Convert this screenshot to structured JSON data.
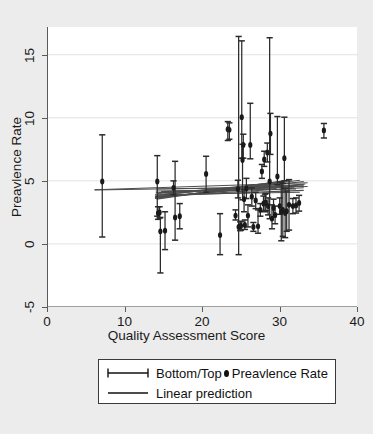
{
  "chart_data": {
    "type": "scatter",
    "title": "",
    "xlabel": "Quality Assessment Score",
    "ylabel": "Preavlence Rate",
    "xlim": [
      0,
      40
    ],
    "ylim": [
      -5,
      17.2
    ],
    "xticks": [
      0,
      10,
      20,
      30,
      40
    ],
    "yticks": [
      -5,
      0,
      5,
      10,
      15
    ],
    "grid": "horizontal",
    "legend_position": "below-axis",
    "series": [
      {
        "name": "Bottom/Top",
        "type": "errorbar",
        "marker": "capped-vertical-line"
      },
      {
        "name": "Preavlence Rate",
        "type": "scatter",
        "marker": "filled-circle",
        "color": "#1a1a1a"
      },
      {
        "name": "Linear prediction",
        "type": "line",
        "color": "#4d4d4d"
      }
    ],
    "points": [
      {
        "x": 7.0,
        "y": 4.95,
        "lo": 0.55,
        "hi": 8.65
      },
      {
        "x": 14.1,
        "y": 4.95,
        "lo": 2.2,
        "hi": 7.0
      },
      {
        "x": 14.2,
        "y": 2.45,
        "lo": 1.95,
        "hi": 2.95
      },
      {
        "x": 14.4,
        "y": 2.5,
        "lo": 2.05,
        "hi": 2.95
      },
      {
        "x": 14.5,
        "y": 1.0,
        "lo": -2.3,
        "hi": 2.1
      },
      {
        "x": 15.1,
        "y": 1.05,
        "lo": -0.45,
        "hi": 2.55
      },
      {
        "x": 16.2,
        "y": 4.45,
        "lo": 3.9,
        "hi": 5.0
      },
      {
        "x": 16.4,
        "y": 2.1,
        "lo": 0.3,
        "hi": 6.55
      },
      {
        "x": 17.0,
        "y": 2.2,
        "lo": 1.2,
        "hi": 3.2
      },
      {
        "x": 20.4,
        "y": 5.55,
        "lo": 4.1,
        "hi": 6.95
      },
      {
        "x": 22.2,
        "y": 0.7,
        "lo": -0.85,
        "hi": 2.4
      },
      {
        "x": 23.2,
        "y": 9.1,
        "lo": 8.2,
        "hi": 9.7
      },
      {
        "x": 23.4,
        "y": 9.05,
        "lo": 8.3,
        "hi": 9.6
      },
      {
        "x": 24.2,
        "y": 2.25,
        "lo": 1.9,
        "hi": 2.7
      },
      {
        "x": 24.5,
        "y": 4.35,
        "lo": 3.65,
        "hi": 5.05
      },
      {
        "x": 24.6,
        "y": 1.35,
        "lo": -0.85,
        "hi": 16.45
      },
      {
        "x": 24.8,
        "y": 1.4,
        "lo": 1.05,
        "hi": 1.75
      },
      {
        "x": 24.9,
        "y": 1.45,
        "lo": 1.1,
        "hi": 1.8
      },
      {
        "x": 25.0,
        "y": 10.05,
        "lo": 6.8,
        "hi": 16.1
      },
      {
        "x": 25.1,
        "y": 6.65,
        "lo": 3.5,
        "hi": 7.9
      },
      {
        "x": 25.2,
        "y": 7.85,
        "lo": 6.8,
        "hi": 8.7
      },
      {
        "x": 25.3,
        "y": 3.55,
        "lo": 2.55,
        "hi": 4.3
      },
      {
        "x": 25.4,
        "y": 1.5,
        "lo": 1.15,
        "hi": 1.9
      },
      {
        "x": 25.6,
        "y": 4.4,
        "lo": 3.6,
        "hi": 5.2
      },
      {
        "x": 25.8,
        "y": 2.25,
        "lo": 1.35,
        "hi": 3.1
      },
      {
        "x": 26.1,
        "y": 7.85,
        "lo": 6.75,
        "hi": 11.15
      },
      {
        "x": 26.3,
        "y": 3.75,
        "lo": 3.0,
        "hi": 4.45
      },
      {
        "x": 26.5,
        "y": 1.35,
        "lo": 1.0,
        "hi": 1.7
      },
      {
        "x": 26.8,
        "y": 3.45,
        "lo": 2.8,
        "hi": 4.1
      },
      {
        "x": 27.1,
        "y": 1.4,
        "lo": 0.85,
        "hi": 2.7
      },
      {
        "x": 27.4,
        "y": 2.7,
        "lo": 2.2,
        "hi": 3.2
      },
      {
        "x": 27.6,
        "y": 5.75,
        "lo": 5.2,
        "hi": 6.3
      },
      {
        "x": 27.8,
        "y": 3.2,
        "lo": 2.6,
        "hi": 3.8
      },
      {
        "x": 27.9,
        "y": 6.7,
        "lo": 6.15,
        "hi": 7.35
      },
      {
        "x": 28.0,
        "y": 3.25,
        "lo": 2.55,
        "hi": 3.95
      },
      {
        "x": 28.1,
        "y": 3.3,
        "lo": 2.65,
        "hi": 4.0
      },
      {
        "x": 28.3,
        "y": 7.25,
        "lo": 6.5,
        "hi": 8.0
      },
      {
        "x": 28.4,
        "y": 3.0,
        "lo": 2.3,
        "hi": 3.65
      },
      {
        "x": 28.6,
        "y": 4.95,
        "lo": 2.0,
        "hi": 16.35
      },
      {
        "x": 28.7,
        "y": 8.75,
        "lo": 7.1,
        "hi": 10.35
      },
      {
        "x": 28.9,
        "y": 2.0,
        "lo": 1.2,
        "hi": 3.1
      },
      {
        "x": 29.1,
        "y": 2.85,
        "lo": 2.15,
        "hi": 3.55
      },
      {
        "x": 29.3,
        "y": 2.3,
        "lo": 1.6,
        "hi": 3.0
      },
      {
        "x": 29.6,
        "y": 5.35,
        "lo": 4.7,
        "hi": 10.1
      },
      {
        "x": 29.9,
        "y": 3.0,
        "lo": 2.35,
        "hi": 3.65
      },
      {
        "x": 30.1,
        "y": 2.55,
        "lo": 0.25,
        "hi": 4.9
      },
      {
        "x": 30.3,
        "y": 2.7,
        "lo": 0.6,
        "hi": 4.8
      },
      {
        "x": 30.5,
        "y": 6.8,
        "lo": 5.0,
        "hi": 10.05
      },
      {
        "x": 30.6,
        "y": 2.45,
        "lo": 0.5,
        "hi": 4.4
      },
      {
        "x": 30.8,
        "y": 2.6,
        "lo": 1.0,
        "hi": 4.2
      },
      {
        "x": 31.1,
        "y": 3.1,
        "lo": 1.1,
        "hi": 5.1
      },
      {
        "x": 31.6,
        "y": 3.0,
        "lo": 2.4,
        "hi": 3.6
      },
      {
        "x": 32.0,
        "y": 3.05,
        "lo": 2.45,
        "hi": 3.65
      },
      {
        "x": 32.4,
        "y": 3.25,
        "lo": 2.6,
        "hi": 3.85
      },
      {
        "x": 35.6,
        "y": 9.0,
        "lo": 8.4,
        "hi": 9.55
      }
    ],
    "linear_predictions": [
      {
        "x0": 6.0,
        "y0": 4.3,
        "x1": 33.5,
        "y1": 4.85
      },
      {
        "x0": 6.0,
        "y0": 4.28,
        "x1": 33.5,
        "y1": 4.55
      },
      {
        "x0": 13.8,
        "y0": 3.65,
        "x1": 33.0,
        "y1": 4.95
      },
      {
        "x0": 13.8,
        "y0": 3.7,
        "x1": 33.0,
        "y1": 4.7
      },
      {
        "x0": 13.8,
        "y0": 3.75,
        "x1": 33.0,
        "y1": 4.45
      },
      {
        "x0": 13.8,
        "y0": 3.8,
        "x1": 33.0,
        "y1": 4.25
      },
      {
        "x0": 13.8,
        "y0": 3.6,
        "x1": 32.5,
        "y1": 5.05
      },
      {
        "x0": 13.8,
        "y0": 3.9,
        "x1": 32.5,
        "y1": 4.1
      },
      {
        "x0": 13.9,
        "y0": 4.05,
        "x1": 32.0,
        "y1": 4.6
      },
      {
        "x0": 13.9,
        "y0": 4.2,
        "x1": 32.0,
        "y1": 4.35
      },
      {
        "x0": 14.0,
        "y0": 4.35,
        "x1": 31.8,
        "y1": 4.5
      },
      {
        "x0": 14.0,
        "y0": 3.55,
        "x1": 31.5,
        "y1": 5.1
      },
      {
        "x0": 14.2,
        "y0": 4.0,
        "x1": 31.0,
        "y1": 4.8
      },
      {
        "x0": 14.2,
        "y0": 3.85,
        "x1": 30.5,
        "y1": 4.95
      },
      {
        "x0": 14.4,
        "y0": 3.7,
        "x1": 30.0,
        "y1": 4.65
      },
      {
        "x0": 14.6,
        "y0": 4.15,
        "x1": 29.5,
        "y1": 4.4
      },
      {
        "x0": 15.0,
        "y0": 3.95,
        "x1": 29.0,
        "y1": 4.7
      },
      {
        "x0": 16.0,
        "y0": 3.8,
        "x1": 28.5,
        "y1": 4.55
      },
      {
        "x0": 17.0,
        "y0": 4.1,
        "x1": 33.0,
        "y1": 4.6
      },
      {
        "x0": 20.0,
        "y0": 4.2,
        "x1": 33.2,
        "y1": 4.75
      }
    ]
  },
  "axis": {
    "x_title": "Quality Assessment Score",
    "y_title": "Preavlence Rate",
    "x_tick_labels": [
      "0",
      "10",
      "20",
      "30",
      "40"
    ],
    "y_tick_labels": [
      "-5",
      "0",
      "5",
      "10",
      "15"
    ]
  },
  "legend": {
    "rows": [
      {
        "label_a": "Bottom/Top",
        "key_a": "errorbar-key-icon",
        "label_b": "Preavlence Rate",
        "key_b": "dot-marker-icon"
      },
      {
        "label_a": "Linear prediction",
        "key_a": "line-key-icon"
      }
    ]
  },
  "colors": {
    "marker": "#1a1a1a",
    "errorbar": "#2b2b2b",
    "prediction_line": "#4d4d4d",
    "grid": "#e2e2e2",
    "axis": "#5a5a5a",
    "background": "#ececec",
    "plot_background": "#ffffff"
  }
}
